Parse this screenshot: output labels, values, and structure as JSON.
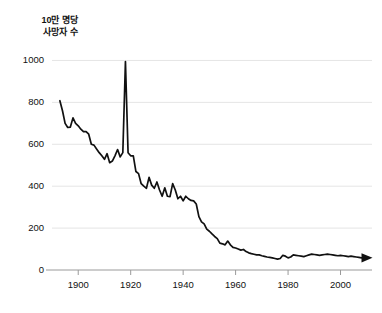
{
  "chart_data": {
    "type": "line",
    "title": "",
    "subtitle": "",
    "ylabel_lines": [
      "10만 명당",
      "사망자 수"
    ],
    "xlabel": "",
    "ylim": [
      0,
      1050
    ],
    "xlim": [
      1890,
      2012
    ],
    "grid": "horizontal-light",
    "legend": "none",
    "yticks": [
      0,
      200,
      400,
      600,
      800,
      1000
    ],
    "ytick_labels": [
      "0",
      "200",
      "400",
      "600",
      "800",
      "1000"
    ],
    "xticks": [
      1900,
      1920,
      1940,
      1960,
      1980,
      2000
    ],
    "xtick_labels": [
      "1900",
      "1920",
      "1940",
      "1960",
      "1980",
      "2000"
    ],
    "line_color": "#111111",
    "grid_color": "#dedede",
    "axis_color": "#9a9a9a",
    "end_marker": "arrowhead-right",
    "annotations": [],
    "series": [
      {
        "name": "deaths per 100,000",
        "x": [
          1893,
          1894,
          1895,
          1896,
          1897,
          1898,
          1899,
          1900,
          1901,
          1902,
          1903,
          1904,
          1905,
          1906,
          1907,
          1908,
          1909,
          1910,
          1911,
          1912,
          1913,
          1914,
          1915,
          1916,
          1917,
          1918,
          1919,
          1920,
          1921,
          1922,
          1923,
          1924,
          1925,
          1926,
          1927,
          1928,
          1929,
          1930,
          1931,
          1932,
          1933,
          1934,
          1935,
          1936,
          1937,
          1938,
          1939,
          1940,
          1941,
          1942,
          1943,
          1944,
          1945,
          1946,
          1947,
          1948,
          1949,
          1950,
          1951,
          1952,
          1953,
          1954,
          1955,
          1956,
          1957,
          1958,
          1959,
          1960,
          1961,
          1962,
          1963,
          1964,
          1965,
          1966,
          1967,
          1968,
          1969,
          1970,
          1971,
          1972,
          1973,
          1974,
          1975,
          1976,
          1977,
          1978,
          1979,
          1980,
          1981,
          1982,
          1983,
          1984,
          1985,
          1986,
          1987,
          1988,
          1989,
          1990,
          1991,
          1992,
          1993,
          1994,
          1995,
          1996,
          1997,
          1998,
          1999,
          2000,
          2001,
          2002,
          2003,
          2004,
          2005,
          2006,
          2007,
          2008
        ],
        "values": [
          808,
          760,
          700,
          680,
          682,
          726,
          700,
          688,
          672,
          660,
          660,
          648,
          600,
          596,
          578,
          560,
          545,
          528,
          555,
          512,
          520,
          545,
          575,
          540,
          560,
          995,
          560,
          545,
          545,
          470,
          460,
          412,
          400,
          390,
          442,
          405,
          390,
          420,
          382,
          352,
          392,
          352,
          350,
          412,
          382,
          340,
          352,
          330,
          352,
          340,
          332,
          330,
          315,
          255,
          230,
          220,
          195,
          185,
          172,
          160,
          150,
          128,
          125,
          120,
          138,
          120,
          108,
          105,
          100,
          95,
          98,
          88,
          82,
          78,
          75,
          72,
          72,
          68,
          65,
          62,
          60,
          58,
          55,
          52,
          55,
          70,
          66,
          58,
          62,
          72,
          70,
          68,
          66,
          64,
          68,
          72,
          76,
          74,
          72,
          70,
          72,
          74,
          76,
          74,
          72,
          70,
          68,
          70,
          68,
          66,
          64,
          66,
          64,
          62,
          60,
          58
        ]
      }
    ]
  }
}
